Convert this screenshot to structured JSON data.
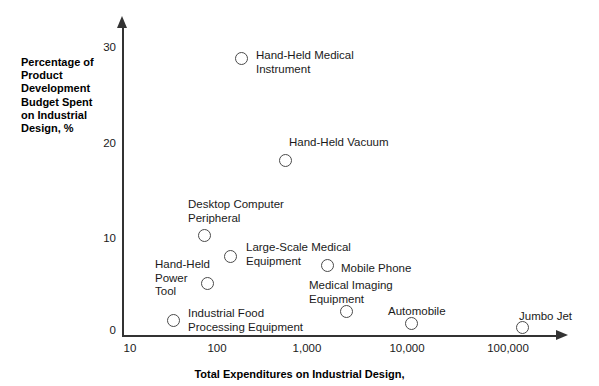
{
  "chart_data": {
    "type": "scatter",
    "title": "",
    "xlabel": "Total Expenditures on Industrial Design,",
    "ylabel": "Percentage of\nProduct\nDevelopment\nBudget Spent\non Industrial\nDesign, %",
    "xscale": "log",
    "xlim": [
      10,
      200000
    ],
    "ylim": [
      0,
      32
    ],
    "grid": false,
    "legend": "none",
    "xticks": [
      {
        "value": 10,
        "label": "10",
        "x": 130
      },
      {
        "value": 100,
        "label": "100",
        "x": 217
      },
      {
        "value": 1000,
        "label": "1,000",
        "x": 307
      },
      {
        "value": 10000,
        "label": "10,000",
        "x": 407
      },
      {
        "value": 100000,
        "label": "100,000",
        "x": 508
      }
    ],
    "yticks": [
      {
        "value": 0,
        "label": "0",
        "y": 330
      },
      {
        "value": 10,
        "label": "10",
        "y": 238
      },
      {
        "value": 20,
        "label": "20",
        "y": 143
      },
      {
        "value": 30,
        "label": "30",
        "y": 47
      }
    ],
    "points": [
      {
        "label": "Hand-Held Medical\nInstrument",
        "x": 180,
        "y": 28.8,
        "px": 241,
        "py": 58,
        "lx": 256,
        "ly": 49
      },
      {
        "label": "Hand-Held Vacuum",
        "x": 550,
        "y": 18.3,
        "px": 285,
        "py": 160,
        "lx": 289,
        "ly": 136
      },
      {
        "label": "Desktop Computer\nPeripheral",
        "x": 78,
        "y": 10.4,
        "px": 204,
        "py": 235,
        "lx": 188,
        "ly": 198
      },
      {
        "label": "Large-Scale Medical\nEquipment",
        "x": 130,
        "y": 8.2,
        "px": 230,
        "py": 256,
        "lx": 246,
        "ly": 241
      },
      {
        "label": "Hand-Held\nPower\nTool",
        "x": 80,
        "y": 5.4,
        "px": 207,
        "py": 283,
        "lx": 155,
        "ly": 258
      },
      {
        "label": "Mobile Phone",
        "x": 2400,
        "y": 7.5,
        "px": 327,
        "py": 265,
        "lx": 341,
        "ly": 262
      },
      {
        "label": "Medical Imaging\nEquipment",
        "x": 2400,
        "y": 2.4,
        "px": 346,
        "py": 311,
        "lx": 309,
        "ly": 279
      },
      {
        "label": "Industrial Food\nProcessing Equipment",
        "x": 30,
        "y": 1.4,
        "px": 173,
        "py": 320,
        "lx": 188,
        "ly": 307
      },
      {
        "label": "Automobile",
        "x": 11000,
        "y": 1.1,
        "px": 411,
        "py": 323,
        "lx": 388,
        "ly": 305
      },
      {
        "label": "Jumbo Jet",
        "x": 130000,
        "y": 0.8,
        "px": 522,
        "py": 327,
        "lx": 519,
        "ly": 310
      }
    ]
  }
}
